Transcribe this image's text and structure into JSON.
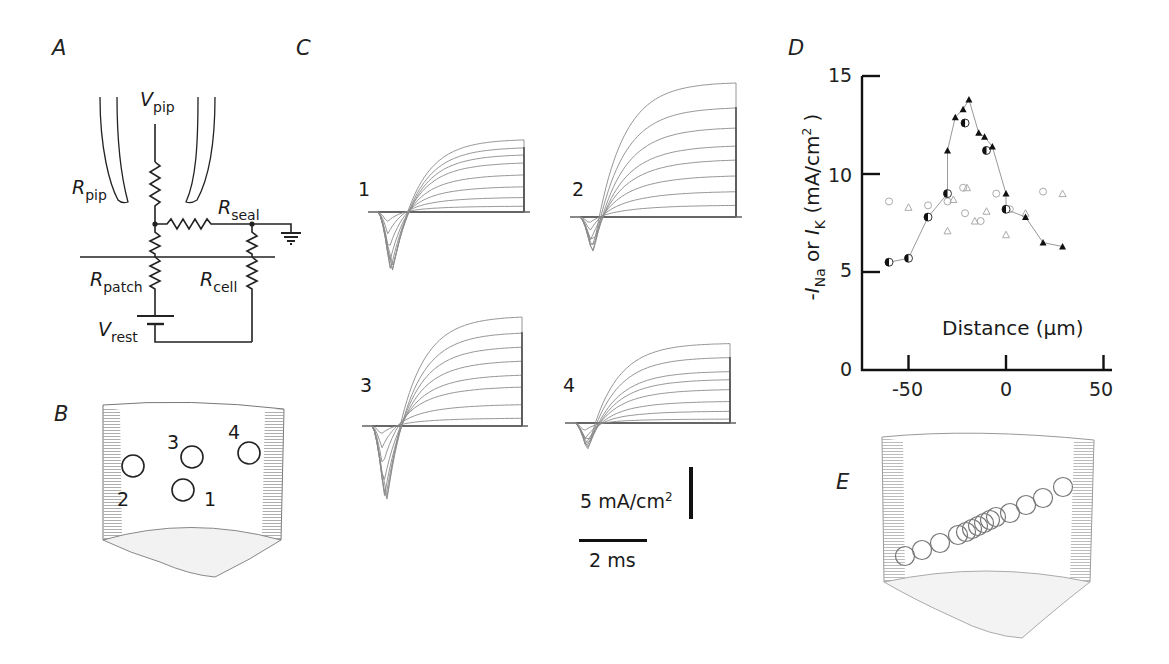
{
  "panels": {
    "A": {
      "label": "A",
      "circuit": {
        "V_pip": {
          "main": "V",
          "sub": "pip"
        },
        "R_pip": {
          "main": "R",
          "sub": "pip"
        },
        "R_seal": {
          "main": "R",
          "sub": "seal"
        },
        "R_patch": {
          "main": "R",
          "sub": "patch"
        },
        "R_cell": {
          "main": "R",
          "sub": "cell"
        },
        "V_rest": {
          "main": "V",
          "sub": "rest"
        }
      }
    },
    "B": {
      "label": "B",
      "sites": [
        {
          "id": "1",
          "label": "1"
        },
        {
          "id": "2",
          "label": "2"
        },
        {
          "id": "3",
          "label": "3"
        },
        {
          "id": "4",
          "label": "4"
        }
      ]
    },
    "C": {
      "label": "C",
      "trace_labels": [
        "1",
        "2",
        "3",
        "4"
      ],
      "scale_bar_current": {
        "value": "5 mA/cm",
        "sup": "2"
      },
      "scale_bar_time": "2 ms"
    },
    "D": {
      "label": "D",
      "ylabel": {
        "prefix": "-",
        "i1": "I",
        "s1": "Na",
        "mid": " or ",
        "i2": "I",
        "s2": "K",
        "unit": " (mA/cm",
        "sup": "2",
        "close": " )"
      },
      "xlabel": "Distance (μm)",
      "yticks": [
        "0",
        "5",
        "10",
        "15"
      ],
      "xticks": [
        "-50",
        "0",
        "50"
      ]
    },
    "E": {
      "label": "E"
    }
  },
  "chart_data": {
    "type": "scatter",
    "title": "",
    "xlabel": "Distance (μm)",
    "ylabel": "-I_Na or I_K (mA/cm²)",
    "xlim": [
      -70,
      60
    ],
    "ylim": [
      0,
      15
    ],
    "xticks": [
      -50,
      0,
      50
    ],
    "yticks": [
      0,
      5,
      10,
      15
    ],
    "grid": false,
    "legend": null,
    "series": [
      {
        "name": "-I_Na (filled / half-filled, connected)",
        "marker": "filled",
        "line": true,
        "points": [
          [
            -60,
            5.5
          ],
          [
            -50,
            5.7
          ],
          [
            -40,
            7.8
          ],
          [
            -30,
            9.0
          ],
          [
            -30,
            11.2
          ],
          [
            -26,
            12.9
          ],
          [
            -22,
            13.3
          ],
          [
            -19,
            13.8
          ],
          [
            -21,
            12.6
          ],
          [
            -14,
            12.1
          ],
          [
            -11,
            11.9
          ],
          [
            -10,
            11.2
          ],
          [
            -7,
            11.4
          ],
          [
            0,
            9.0
          ],
          [
            0,
            8.2
          ],
          [
            10,
            7.8
          ],
          [
            19,
            6.5
          ],
          [
            29,
            6.3
          ]
        ]
      },
      {
        "name": "I_K (open symbols, unconnected)",
        "marker": "open",
        "line": false,
        "points": [
          [
            -60,
            8.6
          ],
          [
            -50,
            8.3
          ],
          [
            -40,
            8.4
          ],
          [
            -30,
            7.1
          ],
          [
            -30,
            8.6
          ],
          [
            -27,
            8.7
          ],
          [
            -22,
            9.3
          ],
          [
            -20,
            9.3
          ],
          [
            -21,
            8.0
          ],
          [
            -16,
            7.6
          ],
          [
            -13,
            7.6
          ],
          [
            -10,
            8.1
          ],
          [
            -5,
            9.0
          ],
          [
            0,
            6.9
          ],
          [
            2,
            8.2
          ],
          [
            10,
            8.0
          ],
          [
            19,
            9.1
          ],
          [
            29,
            9.0
          ]
        ]
      }
    ]
  }
}
